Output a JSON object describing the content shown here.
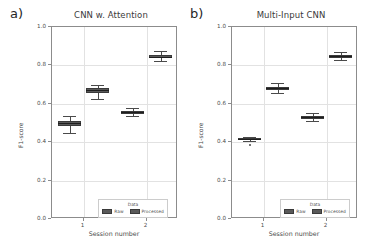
{
  "figure": {
    "panels": [
      {
        "panel_label": "a)",
        "title": "CNN w. Attention",
        "xlabel": "Session number",
        "ylabel": "F1-score"
      },
      {
        "panel_label": "b)",
        "title": "Multi-Input CNN",
        "xlabel": "Session number",
        "ylabel": "F1-score"
      }
    ],
    "legend": {
      "title": "Data",
      "entries": [
        "Raw",
        "Processed"
      ]
    },
    "yticks": [
      "1.0",
      "0.8",
      "0.6",
      "0.4",
      "0.2",
      "0.0"
    ],
    "xticks": [
      "1",
      "2"
    ]
  },
  "chart_data": [
    {
      "type": "box",
      "title": "CNN w. Attention",
      "panel_label": "a)",
      "xlabel": "Session number",
      "ylabel": "F1-score",
      "ylim": [
        0.0,
        1.0
      ],
      "yticks": [
        0.0,
        0.2,
        0.4,
        0.6,
        0.8,
        1.0
      ],
      "categories": [
        "1",
        "2"
      ],
      "grid": true,
      "legend_position": "lower center",
      "series": [
        {
          "name": "Raw",
          "boxes": [
            {
              "category": "1",
              "whisker_low": 0.447,
              "q1": 0.483,
              "median": 0.5,
              "q3": 0.513,
              "whisker_high": 0.537,
              "outliers": []
            },
            {
              "category": "2",
              "whisker_low": 0.538,
              "q1": 0.549,
              "median": 0.556,
              "q3": 0.561,
              "whisker_high": 0.578,
              "outliers": []
            }
          ]
        },
        {
          "name": "Processed",
          "boxes": [
            {
              "category": "1",
              "whisker_low": 0.627,
              "q1": 0.656,
              "median": 0.67,
              "q3": 0.681,
              "whisker_high": 0.7,
              "outliers": []
            },
            {
              "category": "2",
              "whisker_low": 0.822,
              "q1": 0.838,
              "median": 0.846,
              "q3": 0.855,
              "whisker_high": 0.875,
              "outliers": []
            }
          ]
        }
      ]
    },
    {
      "type": "box",
      "title": "Multi-Input CNN",
      "panel_label": "b)",
      "xlabel": "Session number",
      "ylabel": "F1-score",
      "ylim": [
        0.0,
        1.0
      ],
      "yticks": [
        0.0,
        0.2,
        0.4,
        0.6,
        0.8,
        1.0
      ],
      "categories": [
        "1",
        "2"
      ],
      "grid": true,
      "legend_position": "lower center",
      "series": [
        {
          "name": "Raw",
          "boxes": [
            {
              "category": "1",
              "whisker_low": 0.405,
              "q1": 0.411,
              "median": 0.416,
              "q3": 0.421,
              "whisker_high": 0.428,
              "outliers": [
                0.385
              ]
            },
            {
              "category": "2",
              "whisker_low": 0.512,
              "q1": 0.523,
              "median": 0.53,
              "q3": 0.537,
              "whisker_high": 0.551,
              "outliers": []
            }
          ]
        },
        {
          "name": "Processed",
          "boxes": [
            {
              "category": "1",
              "whisker_low": 0.655,
              "q1": 0.673,
              "median": 0.681,
              "q3": 0.687,
              "whisker_high": 0.706,
              "outliers": []
            },
            {
              "category": "2",
              "whisker_low": 0.826,
              "q1": 0.84,
              "median": 0.847,
              "q3": 0.853,
              "whisker_high": 0.868,
              "outliers": []
            }
          ]
        }
      ]
    }
  ]
}
